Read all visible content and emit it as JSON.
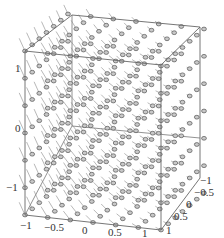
{
  "chart_data": {
    "type": "vector-field-3d",
    "title": "",
    "xlabel": "",
    "ylabel": "",
    "zlabel": "",
    "xlim": [
      -1,
      1
    ],
    "ylim": [
      -1,
      1
    ],
    "zlim": [
      -1,
      1
    ],
    "x_ticks": [
      "-1",
      "-0.5",
      "0",
      "0.5",
      "1"
    ],
    "y_ticks": [
      "-1",
      "-0.5",
      "0",
      "0.5",
      "1"
    ],
    "z_ticks": [
      "-1",
      "0",
      "1"
    ],
    "grid": false,
    "box": true,
    "grid_samples_per_axis": 7,
    "arrow_color": "#555555",
    "box_color": "#666666"
  },
  "axes": {
    "x_tick_labels": [
      "−1",
      "−0.5",
      "0",
      "0.5",
      "1"
    ],
    "y_tick_labels": [
      "−1",
      "−0.5",
      "0",
      "0.5",
      "1"
    ],
    "z_tick_labels": [
      "1",
      "0",
      "−1"
    ]
  }
}
